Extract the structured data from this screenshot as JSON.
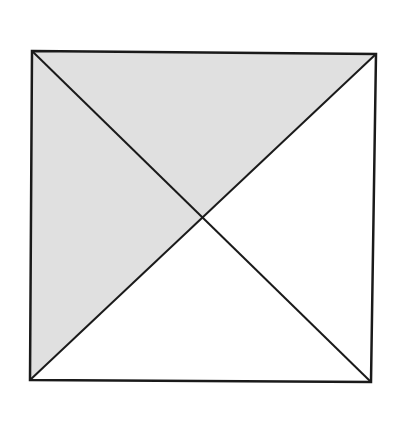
{
  "diagram": {
    "type": "square-with-diagonals",
    "colors": {
      "shade": "#e0e0e0",
      "stroke": "#1a1a1a",
      "background": "#ffffff"
    },
    "vertices": {
      "top_left": [
        32,
        51
      ],
      "top_right": [
        376,
        54
      ],
      "bottom_right": [
        371,
        382
      ],
      "bottom_left": [
        30,
        380
      ],
      "center": [
        202,
        217
      ]
    },
    "shaded_regions": [
      "top-triangle",
      "left-triangle"
    ],
    "unshaded_regions": [
      "right-triangle",
      "bottom-triangle"
    ]
  }
}
